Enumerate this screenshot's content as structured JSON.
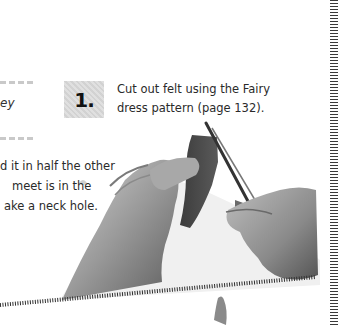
{
  "page": {
    "side_note_word": "ey",
    "step": {
      "number": "1.",
      "text_line1": "Cut out felt using the Fairy",
      "text_line2": "dress pattern (page 132)."
    },
    "paragraph": {
      "line1": "d it in half the other",
      "line2": "meet is in the",
      "line3": "ake a neck hole."
    },
    "photo": {
      "description": "Hands cutting folded felt with scissors"
    },
    "colors": {
      "badge_bg": "#d9d9d9",
      "text": "#2a2a2a",
      "dash": "#c9c9c9",
      "perforation": "#3a3a3a"
    }
  }
}
